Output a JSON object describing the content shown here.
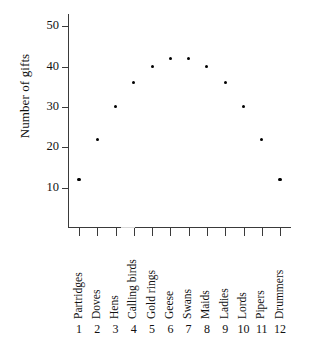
{
  "chart_data": {
    "type": "scatter",
    "title": "",
    "subtitle": "",
    "xlabel": "",
    "ylabel": "Number of gifts",
    "categories": [
      "Partridges",
      "Doves",
      "Hens",
      "Calling birds",
      "Gold rings",
      "Geese",
      "Swans",
      "Maids",
      "Ladies",
      "Lords",
      "Pipers",
      "Drummers"
    ],
    "x": [
      1,
      2,
      3,
      4,
      5,
      6,
      7,
      8,
      9,
      10,
      11,
      12
    ],
    "x_tick_labels": [
      "1",
      "2",
      "3",
      "4",
      "5",
      "6",
      "7",
      "8",
      "9",
      "10",
      "11",
      "12"
    ],
    "values": [
      12,
      22,
      30,
      36,
      40,
      42,
      42,
      40,
      36,
      30,
      22,
      12
    ],
    "y_tick_labels": [
      "10",
      "20",
      "30",
      "40",
      "50"
    ],
    "y_ticks": [
      10,
      20,
      30,
      40,
      50
    ],
    "ylim": [
      0,
      53
    ],
    "xlim": [
      0.4,
      12.6
    ],
    "grid": false,
    "legend": false,
    "legend_position": "none",
    "marker": "filled-circle",
    "marker_color": "#000000",
    "axis_color": "#3a3a3a",
    "background": "#ffffff"
  }
}
